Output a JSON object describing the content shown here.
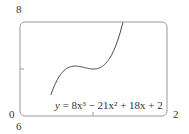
{
  "chart_data": {
    "type": "line",
    "title": "",
    "xlabel": "",
    "ylabel": "",
    "xlim": [
      0,
      2
    ],
    "ylim": [
      6,
      8
    ],
    "x_tick_labels": {
      "min": "0",
      "max": "2"
    },
    "y_tick_labels": {
      "min": "6",
      "max": "8"
    },
    "grid": false,
    "annotation": "y = 8x³ − 21x² + 18x + 2",
    "series": [
      {
        "name": "y = 8x^3 - 21x^2 + 18x + 2",
        "x": [
          0.45,
          0.5,
          0.6,
          0.7,
          0.75,
          0.8,
          0.9,
          1.0,
          1.1,
          1.2,
          1.3,
          1.4
        ],
        "y": [
          6.58,
          6.75,
          7.02,
          7.13,
          7.16,
          7.14,
          7.02,
          7.0,
          7.07,
          7.26,
          7.59,
          7.99
        ]
      }
    ]
  },
  "labels": {
    "y_max": "8",
    "x_min": "0",
    "y_min": "6",
    "x_max": "2"
  },
  "equation": {
    "prefix": "y",
    "rest": " = 8x³ − 21x² + 18x + 2"
  }
}
